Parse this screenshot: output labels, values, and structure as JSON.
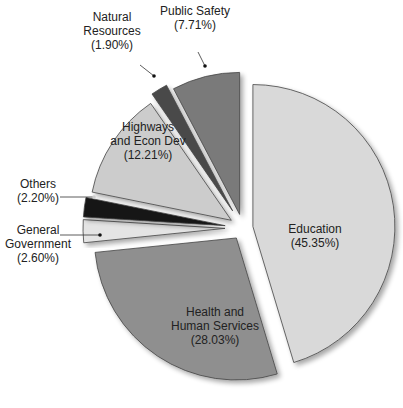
{
  "chart_data": {
    "type": "pie",
    "title": "",
    "exploded": true,
    "start_angle_deg": 0,
    "direction": "clockwise",
    "slices": [
      {
        "name": "Education",
        "label_lines": [
          "Education",
          "(45.35%)"
        ],
        "value": 45.35,
        "color": "#d9d9d9",
        "label_inside": true
      },
      {
        "name": "Health and Human Services",
        "label_lines": [
          "Health and",
          "Human Services",
          "(28.03%)"
        ],
        "value": 28.03,
        "color": "#8f8f8f",
        "label_inside": true
      },
      {
        "name": "General Government",
        "label_lines": [
          "General",
          "Government",
          "(2.60%)"
        ],
        "value": 2.6,
        "color": "#e4e4e4",
        "label_inside": false
      },
      {
        "name": "Others",
        "label_lines": [
          "Others",
          "(2.20%)"
        ],
        "value": 2.2,
        "color": "#141414",
        "label_inside": false
      },
      {
        "name": "Highways and Econ Dev",
        "label_lines": [
          "Highways",
          "and Econ Dev",
          "(12.21%)"
        ],
        "value": 12.21,
        "color": "#cccccc",
        "label_inside": true
      },
      {
        "name": "Natural Resources",
        "label_lines": [
          "Natural",
          "Resources",
          "(1.90%)"
        ],
        "value": 1.9,
        "color": "#4a4a4a",
        "label_inside": false
      },
      {
        "name": "Public Safety",
        "label_lines": [
          "Public Safety",
          "(7.71%)"
        ],
        "value": 7.71,
        "color": "#7a7a7a",
        "label_inside": false
      }
    ]
  }
}
